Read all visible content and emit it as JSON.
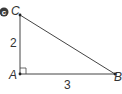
{
  "badge": {
    "label": "c",
    "color": "#3a3a3a"
  },
  "triangle": {
    "vertices": {
      "A": "A",
      "B": "B",
      "C": "C"
    },
    "sides": {
      "AC": "2",
      "AB": "3"
    },
    "right_angle_at": "A",
    "line_color": "#444444"
  }
}
